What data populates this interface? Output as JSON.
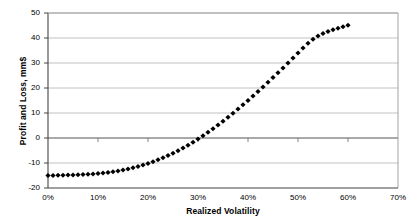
{
  "chart_data": {
    "type": "scatter",
    "title": "",
    "xlabel": "Realized Volatility",
    "ylabel": "Profit and Loss, mm$",
    "xlim": [
      0,
      70
    ],
    "ylim": [
      -20,
      50
    ],
    "xtick_labels": [
      "0%",
      "10%",
      "20%",
      "30%",
      "40%",
      "50%",
      "60%",
      "70%"
    ],
    "xtick_values": [
      0,
      10,
      20,
      30,
      40,
      50,
      60,
      70
    ],
    "ytick_labels": [
      "50",
      "40",
      "30",
      "20",
      "10",
      "0",
      "-10",
      "-20"
    ],
    "ytick_values": [
      50,
      40,
      30,
      20,
      10,
      0,
      -10,
      -20
    ],
    "grid": true,
    "grid_axis": "y",
    "legend": false,
    "marker": "diamond",
    "marker_color": "#000000",
    "series": [
      {
        "name": "Profit and Loss",
        "x": [
          0,
          1,
          2,
          3,
          4,
          5,
          6,
          7,
          8,
          9,
          10,
          11,
          12,
          13,
          14,
          15,
          16,
          17,
          18,
          19,
          20,
          21,
          22,
          23,
          24,
          25,
          26,
          27,
          28,
          29,
          30,
          31,
          32,
          33,
          34,
          35,
          36,
          37,
          38,
          39,
          40,
          41,
          42,
          43,
          44,
          45,
          46,
          47,
          48,
          49,
          50,
          51,
          52,
          53,
          54,
          55,
          56,
          57,
          58,
          59,
          60
        ],
        "values": [
          -15.0,
          -15.0,
          -14.9,
          -14.9,
          -14.8,
          -14.8,
          -14.7,
          -14.6,
          -14.5,
          -14.4,
          -14.2,
          -14.0,
          -13.8,
          -13.5,
          -13.2,
          -12.8,
          -12.4,
          -11.9,
          -11.4,
          -10.8,
          -10.2,
          -9.5,
          -8.7,
          -7.9,
          -7.0,
          -6.1,
          -5.1,
          -4.0,
          -2.9,
          -1.7,
          -0.4,
          0.9,
          2.3,
          3.7,
          5.2,
          6.7,
          8.3,
          9.9,
          11.6,
          13.3,
          15.0,
          16.8,
          18.6,
          20.4,
          22.3,
          24.2,
          26.1,
          28.0,
          30.0,
          32.0,
          34.0,
          36.0,
          37.9,
          39.5,
          40.8,
          41.8,
          42.6,
          43.3,
          43.9,
          44.5,
          45.1
        ]
      }
    ]
  }
}
